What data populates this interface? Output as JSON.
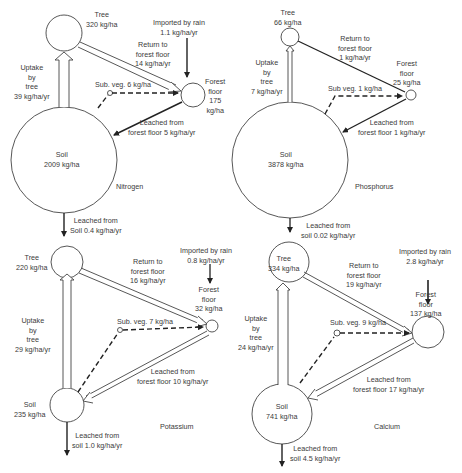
{
  "panels": [
    {
      "element": "Nitrogen",
      "tree": {
        "label": "Tree",
        "value": "320 kg/ha"
      },
      "rain": {
        "line1": "Imported by rain",
        "line2": "1.1 kg/ha/yr"
      },
      "return": {
        "line1": "Return to",
        "line2": "forest floor",
        "line3": "14 kg/ha/yr"
      },
      "uptake": {
        "line1": "Uptake",
        "line2": "by",
        "line3": "tree",
        "line4": "39 kg/ha/yr"
      },
      "subveg": "Sub. veg. 6 kg/ha",
      "floor": {
        "line1": "Forest",
        "line2": "floor",
        "line3": "175",
        "line4": "kg/ha"
      },
      "leach_floor": {
        "line1": "Leached from",
        "line2": "forest floor 5 kg/ha/yr"
      },
      "soil": {
        "label": "Soil",
        "value": "2009 kg/ha"
      },
      "leach_soil": {
        "line1": "Leached from",
        "line2": "Soil 0.4 kg/ha/yr"
      }
    },
    {
      "element": "Phosphorus",
      "tree": {
        "label": "Tree",
        "value": "66 kg/ha"
      },
      "return": {
        "line1": "Return to",
        "line2": "forest floor",
        "line3": "1 kg/ha/yr"
      },
      "uptake": {
        "line1": "Uptake",
        "line2": "by",
        "line3": "tree",
        "line4": "7 kg/ha/yr"
      },
      "subveg": "Sub veg. 1 kg/ha",
      "floor": {
        "line1": "Forest",
        "line2": "floor",
        "line3": "25 kg/ha"
      },
      "leach_floor": {
        "line1": "Leached from",
        "line2": "forest floor 1 kg/ha/yr"
      },
      "soil": {
        "label": "Soil",
        "value": "3878 kg/ha"
      },
      "leach_soil": {
        "line1": "Leached from",
        "line2": "soil 0.02 kg/ha/yr"
      }
    },
    {
      "element": "Potassium",
      "tree": {
        "label": "Tree",
        "value": "220 kg/ha"
      },
      "rain": {
        "line1": "Imported by rain",
        "line2": "0.8 kg/ha/yr"
      },
      "return": {
        "line1": "Return to",
        "line2": "forest floor",
        "line3": "16 kg/ha/yr"
      },
      "uptake": {
        "line1": "Uptake",
        "line2": "by",
        "line3": "tree",
        "line4": "29 kg/ha/yr"
      },
      "subveg": "Sub. veg. 7 kg/ha",
      "floor": {
        "line1": "Forest",
        "line2": "floor",
        "line3": "32 kg/ha"
      },
      "leach_floor": {
        "line1": "Leached from",
        "line2": "forest floor 10 kg/ha/yr"
      },
      "soil": {
        "label": "Soil",
        "value": "235 kg/ha"
      },
      "leach_soil": {
        "line1": "Leached from",
        "line2": "soil 1.0 kg/ha/yr"
      }
    },
    {
      "element": "Calcium",
      "tree": {
        "label": "Tree",
        "value": "334 kg/ha"
      },
      "rain": {
        "line1": "Imported by rain",
        "line2": "2.8 kg/ha/yr"
      },
      "return": {
        "line1": "Return to",
        "line2": "forest floor",
        "line3": "19 kg/ha/yr"
      },
      "uptake": {
        "line1": "Uptake",
        "line2": "by",
        "line3": "tree",
        "line4": "24 kg/ha/yr"
      },
      "subveg": "Sub. veg. 9 kg/ha",
      "floor": {
        "line1": "Forest",
        "line2": "floor",
        "line3": "137 kg/ha"
      },
      "leach_floor": {
        "line1": "Leached from",
        "line2": "forest floor 17 kg/ha/yr"
      },
      "soil": {
        "label": "Soil",
        "value": "741 kg/ha"
      },
      "leach_soil": {
        "line1": "Leached from",
        "line2": "soil 4.5 kg/ha/yr"
      }
    }
  ]
}
